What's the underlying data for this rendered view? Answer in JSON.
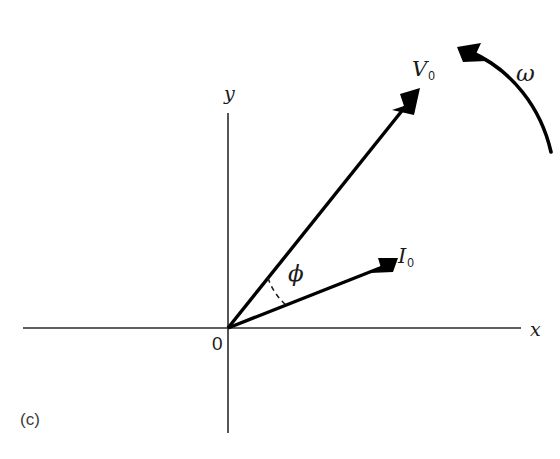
{
  "figure": {
    "caption": "(c)",
    "background_color": "#ffffff",
    "ink_color": "#000000",
    "width": 560,
    "height": 459
  },
  "axes": {
    "x_label": "x",
    "y_label": "y",
    "origin_label": "0",
    "origin_px": {
      "x": 228,
      "y": 328
    },
    "x_axis": {
      "x1": 23,
      "y1": 328,
      "x2": 521,
      "y2": 328
    },
    "y_axis": {
      "x1": 228,
      "y1": 113,
      "x2": 228,
      "y2": 433
    }
  },
  "vectors": [
    {
      "name": "V0",
      "label": "V",
      "subscript": "0",
      "from": {
        "x": 228,
        "y": 328
      },
      "to": {
        "x": 420,
        "y": 89
      },
      "angle_from_x_axis_deg": 51,
      "label_px": {
        "x": 415,
        "y": 60
      }
    },
    {
      "name": "I0",
      "label": "I",
      "subscript": "0",
      "from": {
        "x": 228,
        "y": 328
      },
      "to": {
        "x": 398,
        "y": 258
      },
      "angle_from_x_axis_deg": 22,
      "label_px": {
        "x": 399,
        "y": 248
      }
    }
  ],
  "angle": {
    "symbol": "ϕ",
    "name": "phi",
    "between": [
      "V0",
      "I0"
    ],
    "label_px": {
      "x": 290,
      "y": 265
    },
    "arc_radius_px": 64,
    "arc_style": "dashed"
  },
  "rotation": {
    "symbol": "ω",
    "name": "omega",
    "direction": "counterclockwise",
    "label_px": {
      "x": 518,
      "y": 62
    },
    "arc_start": {
      "x": 551,
      "y": 152
    },
    "arc_end": {
      "x": 462,
      "y": 50
    }
  }
}
